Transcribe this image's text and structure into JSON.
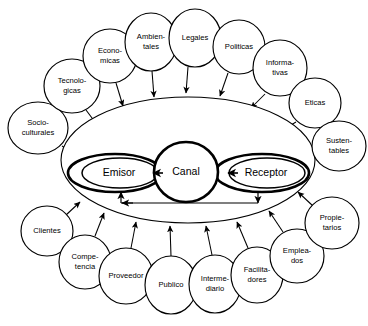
{
  "diagram": {
    "core": {
      "sender": {
        "label": "Emisor",
        "cx": 115,
        "cy": 173,
        "rx": 47,
        "ry": 19
      },
      "channel": {
        "label": "Canal",
        "cx": 186,
        "cy": 172,
        "rx": 32,
        "ry": 30
      },
      "receiver": {
        "label": "Receptor",
        "cx": 262,
        "cy": 173,
        "rx": 47,
        "ry": 19
      }
    },
    "outer_boundary": {
      "cx": 188,
      "cy": 160,
      "rx": 127,
      "ry": 63
    },
    "environment_factors": [
      {
        "label_lines": [
          "Socio-",
          "culturales"
        ],
        "cx": 38,
        "cy": 128,
        "rx": 30,
        "ry": 26,
        "arrow_from": [
          62,
          146
        ],
        "arrow_to": [
          80,
          157
        ]
      },
      {
        "label_lines": [
          "Tecnolo-",
          "gicas"
        ],
        "cx": 72,
        "cy": 86,
        "rx": 28,
        "ry": 27,
        "arrow_from": [
          86,
          110
        ],
        "arrow_to": [
          98,
          126
        ]
      },
      {
        "label_lines": [
          "Econo-",
          "micas"
        ],
        "cx": 110,
        "cy": 56,
        "rx": 27,
        "ry": 27,
        "arrow_from": [
          116,
          83
        ],
        "arrow_to": [
          123,
          106
        ]
      },
      {
        "label_lines": [
          "Ambien-",
          "tales"
        ],
        "cx": 151,
        "cy": 42,
        "rx": 26,
        "ry": 29,
        "arrow_from": [
          152,
          71
        ],
        "arrow_to": [
          154,
          97
        ]
      },
      {
        "label_lines": [
          "Legales"
        ],
        "cx": 195,
        "cy": 38,
        "rx": 26,
        "ry": 29,
        "arrow_from": [
          188,
          67
        ],
        "arrow_to": [
          186,
          93
        ]
      },
      {
        "label_lines": [
          "Politicas"
        ],
        "cx": 239,
        "cy": 47,
        "rx": 26,
        "ry": 27,
        "arrow_from": [
          228,
          73
        ],
        "arrow_to": [
          220,
          96
        ]
      },
      {
        "label_lines": [
          "Informa-",
          "tivas"
        ],
        "cx": 280,
        "cy": 68,
        "rx": 27,
        "ry": 28,
        "arrow_from": [
          265,
          94
        ],
        "arrow_to": [
          251,
          108
        ]
      },
      {
        "label_lines": [
          "Eticas"
        ],
        "cx": 315,
        "cy": 103,
        "rx": 26,
        "ry": 25,
        "arrow_from": [
          296,
          122
        ],
        "arrow_to": [
          281,
          131
        ]
      },
      {
        "label_lines": [
          "Susten-",
          "tables"
        ],
        "cx": 339,
        "cy": 146,
        "rx": 27,
        "ry": 25,
        "arrow_from": [
          315,
          155
        ],
        "arrow_to": [
          297,
          160
        ]
      }
    ],
    "stakeholders": [
      {
        "label_lines": [
          "Clientes"
        ],
        "cx": 47,
        "cy": 231,
        "rx": 26,
        "ry": 25,
        "arrow_from": [
          66,
          215
        ],
        "arrow_to": [
          80,
          202
        ]
      },
      {
        "label_lines": [
          "Compe-",
          "tencia"
        ],
        "cx": 85,
        "cy": 262,
        "rx": 26,
        "ry": 27,
        "arrow_from": [
          95,
          236
        ],
        "arrow_to": [
          104,
          213
        ]
      },
      {
        "label_lines": [
          "Proveedor"
        ],
        "cx": 126,
        "cy": 276,
        "rx": 27,
        "ry": 28,
        "arrow_from": [
          131,
          248
        ],
        "arrow_to": [
          136,
          222
        ]
      },
      {
        "label_lines": [
          "Publico"
        ],
        "cx": 171,
        "cy": 285,
        "rx": 26,
        "ry": 29,
        "arrow_from": [
          171,
          256
        ],
        "arrow_to": [
          170,
          226
        ]
      },
      {
        "label_lines": [
          "Interme-",
          "diario"
        ],
        "cx": 215,
        "cy": 284,
        "rx": 26,
        "ry": 29,
        "arrow_from": [
          212,
          255
        ],
        "arrow_to": [
          206,
          226
        ]
      },
      {
        "label_lines": [
          "Facilita-",
          "dores"
        ],
        "cx": 257,
        "cy": 275,
        "rx": 26,
        "ry": 28,
        "arrow_from": [
          248,
          248
        ],
        "arrow_to": [
          237,
          222
        ]
      },
      {
        "label_lines": [
          "Emplea-",
          "dos"
        ],
        "cx": 297,
        "cy": 256,
        "rx": 27,
        "ry": 27,
        "arrow_from": [
          283,
          232
        ],
        "arrow_to": [
          269,
          211
        ]
      },
      {
        "label_lines": [
          "Propie-",
          "tarios"
        ],
        "cx": 332,
        "cy": 223,
        "rx": 27,
        "ry": 26,
        "arrow_from": [
          313,
          206
        ],
        "arrow_to": [
          298,
          192
        ]
      }
    ],
    "flow_arrows": [
      {
        "name": "emisor-to-canal",
        "x1": 163,
        "y1": 173,
        "x2": 153,
        "y2": 173
      },
      {
        "name": "canal-to-receptor",
        "x1": 238,
        "y1": 173,
        "x2": 228,
        "y2": 173
      }
    ],
    "feedback": {
      "name": "retroalimentacion",
      "left_x": 121,
      "right_x": 258,
      "y": 203,
      "left_top_y": 192,
      "right_bottom_y": 193
    },
    "colors": {
      "stroke": "#000000",
      "background": "#ffffff",
      "text": "#000000"
    }
  }
}
